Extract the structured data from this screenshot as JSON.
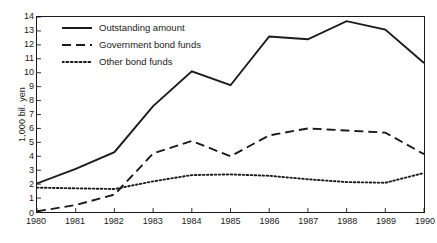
{
  "chart_data": {
    "type": "line",
    "title": "",
    "xlabel": "",
    "ylabel": "1,000 bil. yen",
    "categories": [
      "1980",
      "1981",
      "1982",
      "1983",
      "1984",
      "1985",
      "1986",
      "1987",
      "1988",
      "1989",
      "1990"
    ],
    "x": [
      1980,
      1981,
      1982,
      1983,
      1984,
      1985,
      1986,
      1987,
      1988,
      1989,
      1990
    ],
    "xlim": [
      1980,
      1990
    ],
    "ylim": [
      0,
      14
    ],
    "yticks": [
      0,
      1,
      2,
      3,
      4,
      5,
      6,
      7,
      8,
      9,
      10,
      11,
      12,
      13,
      14
    ],
    "xticks": [
      1980,
      1981,
      1982,
      1983,
      1984,
      1985,
      1986,
      1987,
      1988,
      1989,
      1990
    ],
    "grid": false,
    "legend_position": "upper left",
    "series": [
      {
        "name": "Outstanding amount",
        "style": "solid",
        "color": "#1a1a1a",
        "values": [
          2.05,
          3.1,
          4.3,
          7.6,
          10.1,
          9.1,
          12.6,
          12.4,
          13.7,
          13.1,
          10.7
        ]
      },
      {
        "name": "Government bond funds",
        "style": "dashed",
        "color": "#1a1a1a",
        "values": [
          0.05,
          0.5,
          1.25,
          4.2,
          5.1,
          4.0,
          5.5,
          6.0,
          5.85,
          5.7,
          4.15
        ]
      },
      {
        "name": "Other bond funds",
        "style": "dotted",
        "color": "#1a1a1a",
        "values": [
          1.75,
          1.7,
          1.65,
          2.2,
          2.65,
          2.7,
          2.6,
          2.35,
          2.15,
          2.1,
          2.8
        ]
      }
    ]
  },
  "legend": {
    "items": [
      {
        "label": "Outstanding amount",
        "style": "solid"
      },
      {
        "label": "Government bond funds",
        "style": "dashed"
      },
      {
        "label": "Other bond funds",
        "style": "dotted"
      }
    ]
  },
  "axes": {
    "y_title": "1,000 bil. yen"
  },
  "colors": {
    "ink": "#1a1a1a",
    "background": "#ffffff"
  }
}
